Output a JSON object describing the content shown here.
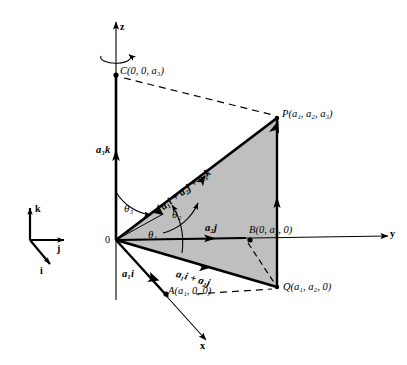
{
  "figure": {
    "type": "geometric-diagram",
    "background": "#ffffff",
    "stroke_color": "#000000",
    "fill_color": "#bfbfbf"
  },
  "axes": {
    "z": {
      "label": "z",
      "x": 116,
      "y_top": 18,
      "y_bottom": 300
    },
    "y": {
      "label": "y",
      "x_start": 116,
      "x_end": 395,
      "y": 240
    },
    "x": {
      "label": "x",
      "x_start": 116,
      "x_end": 212,
      "y_end": 345
    },
    "rotation_icon": "curved-rotation-arrow"
  },
  "basis_triad": {
    "k_label": "k",
    "j_label": "j",
    "i_label": "i",
    "origin": {
      "x": 30,
      "y": 240
    }
  },
  "origin_label": "0",
  "points": [
    {
      "name": "C",
      "label": "C(0, 0, a₃)",
      "base": "C",
      "coords": "(0, 0, a₃)",
      "x": 116,
      "y": 74
    },
    {
      "name": "P",
      "label": "P(a₁, a₂, a₃)",
      "base": "P",
      "coords": "(a₁, a₂, a₃)",
      "x": 277,
      "y": 118
    },
    {
      "name": "B",
      "label": "B(0, a₂, 0)",
      "base": "B",
      "coords": "(0, a₂, 0)",
      "x": 250,
      "y": 240
    },
    {
      "name": "Q",
      "label": "Q(a₁, a₂, 0)",
      "base": "Q",
      "coords": "(a₁, a₂, 0)",
      "x": 277,
      "y": 287
    },
    {
      "name": "A",
      "label": "A(a₁, 0, 0)",
      "base": "A",
      "coords": "(a₁, 0, 0)",
      "x": 165,
      "y": 292
    }
  ],
  "vectors": [
    {
      "name": "a3k",
      "label": "a₃k",
      "scalar": "a₃",
      "unit": "k"
    },
    {
      "name": "a2j",
      "label": "a₂j",
      "scalar": "a₂",
      "unit": "j"
    },
    {
      "name": "a1i",
      "label": "a₁i",
      "scalar": "a₁",
      "unit": "i"
    },
    {
      "name": "a1i_a2j",
      "label": "a₁i + a₂j"
    },
    {
      "name": "resultant",
      "label": "a₁i + a₂j + a₃k"
    }
  ],
  "angles": [
    {
      "name": "theta1",
      "label": "θ₁",
      "between": "x-axis and OQ"
    },
    {
      "name": "theta2",
      "label": "θ₂",
      "between": "y-axis and OP"
    },
    {
      "name": "theta3",
      "label": "θ₃",
      "between": "z-axis and OP"
    }
  ],
  "shaded_region": {
    "name": "triangle-OPQ",
    "vertices": "O, P, Q",
    "fill": "#bfbfbf"
  },
  "dashed_lines": [
    {
      "name": "C-to-P",
      "from": "C",
      "to": "P"
    },
    {
      "name": "A-to-Q",
      "from": "A",
      "to": "Q"
    },
    {
      "name": "B-to-Q",
      "from": "B",
      "to": "Q"
    }
  ]
}
